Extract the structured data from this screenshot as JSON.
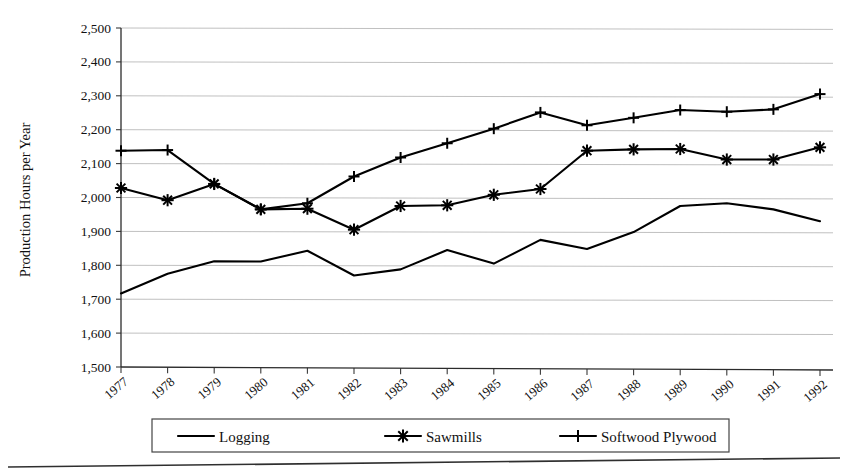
{
  "chart_data": {
    "type": "line",
    "title": "",
    "xlabel": "",
    "ylabel": "Production Hours per Year",
    "ylim": [
      1500,
      2500
    ],
    "ytick_step": 100,
    "grid": true,
    "legend_position": "bottom",
    "categories": [
      "1977",
      "1978",
      "1979",
      "1980",
      "1981",
      "1982",
      "1983",
      "1984",
      "1985",
      "1986",
      "1987",
      "1988",
      "1989",
      "1990",
      "1991",
      "1992"
    ],
    "series": [
      {
        "name": "Logging",
        "marker": "none",
        "values": [
          1717,
          1775,
          1812,
          1811,
          1843,
          1770,
          1788,
          1845,
          1805,
          1875,
          1848,
          1898,
          1975,
          1983,
          1965,
          1930
        ]
      },
      {
        "name": "Sawmills",
        "marker": "asterisk",
        "values": [
          2028,
          1992,
          2040,
          1965,
          1967,
          1905,
          1975,
          1977,
          2008,
          2025,
          2138,
          2142,
          2143,
          2112,
          2112,
          2148
        ]
      },
      {
        "name": "Softwood Plywood",
        "marker": "plus",
        "values": [
          2138,
          2140,
          2040,
          1965,
          1983,
          2062,
          2118,
          2160,
          2203,
          2251,
          2213,
          2235,
          2258,
          2253,
          2260,
          2305
        ]
      }
    ],
    "ytick_labels": [
      "2,500",
      "2,400",
      "2,300",
      "2,200",
      "2,100",
      "2,000",
      "1,900",
      "1,800",
      "1,700",
      "1,600",
      "1,500"
    ],
    "colors": {
      "ink": "#000000",
      "grid": "#b9b9b9",
      "axis": "#2b2b2b"
    }
  },
  "legend": {
    "items": [
      {
        "label": "Logging",
        "marker": "none"
      },
      {
        "label": "Sawmills",
        "marker": "asterisk"
      },
      {
        "label": "Softwood Plywood",
        "marker": "plus"
      }
    ]
  },
  "axis": {
    "y_title": "Production Hours per Year"
  }
}
